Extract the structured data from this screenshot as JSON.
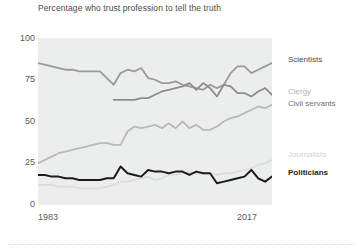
{
  "chart_data": {
    "type": "line",
    "title": "Percentage who trust profession to tell the truth",
    "xlabel": "",
    "ylabel": "",
    "xlim": [
      1983,
      2017
    ],
    "ylim": [
      0,
      100
    ],
    "yticks": [
      0,
      25,
      50,
      75,
      100
    ],
    "ytick_labels": [
      "0",
      "25",
      "50",
      "75",
      "100"
    ],
    "xticks": [
      1983,
      2017
    ],
    "xtick_labels": [
      "1983",
      "2017"
    ],
    "grid": false,
    "legend_position": "right-inline-labels",
    "x": [
      1983,
      1984,
      1985,
      1986,
      1987,
      1988,
      1989,
      1990,
      1991,
      1992,
      1993,
      1994,
      1995,
      1996,
      1997,
      1998,
      1999,
      2000,
      2001,
      2002,
      2003,
      2004,
      2005,
      2006,
      2007,
      2008,
      2009,
      2010,
      2011,
      2012,
      2013,
      2014,
      2015,
      2016,
      2017
    ],
    "series": [
      {
        "name": "Scientists",
        "color": "#9b9b9b",
        "label_color": "#4a4a4a",
        "width": 1.8,
        "values": [
          85,
          84,
          83,
          82,
          81,
          81,
          80,
          80,
          80,
          80,
          76,
          72,
          79,
          81,
          80,
          82,
          76,
          75,
          73,
          73,
          74,
          72,
          71,
          70,
          69,
          72,
          70,
          72,
          79,
          83,
          83,
          79,
          81,
          83,
          85
        ]
      },
      {
        "name": "Clergy",
        "color": "#8d8d8d",
        "label_color": "#b4b4b4",
        "width": 1.8,
        "values": [
          null,
          null,
          null,
          null,
          null,
          null,
          null,
          null,
          null,
          null,
          null,
          63,
          63,
          63,
          63,
          64,
          64,
          66,
          68,
          69,
          70,
          71,
          73,
          69,
          73,
          70,
          65,
          72,
          71,
          67,
          67,
          65,
          68,
          70,
          66
        ]
      },
      {
        "name": "Civil servants",
        "color": "#b9b9b9",
        "label_color": "#6e6e6e",
        "width": 1.8,
        "values": [
          25,
          27,
          29,
          31,
          32,
          33,
          34,
          35,
          36,
          37,
          37,
          36,
          36,
          44,
          47,
          46,
          47,
          48,
          46,
          49,
          46,
          50,
          46,
          48,
          45,
          45,
          47,
          50,
          52,
          53,
          55,
          57,
          59,
          58,
          60
        ]
      },
      {
        "name": "Journalists",
        "color": "#dcdcdc",
        "label_color": "#d2d2d2",
        "width": 1.8,
        "values": [
          12,
          12,
          12,
          11,
          11,
          11,
          10,
          10,
          10,
          10,
          11,
          12,
          14,
          14,
          15,
          16,
          17,
          15,
          16,
          18,
          18,
          19,
          20,
          19,
          19,
          19,
          18,
          19,
          19,
          20,
          21,
          22,
          24,
          25,
          27
        ]
      },
      {
        "name": "Politicians",
        "color": "#1c1c1c",
        "label_color": "#1c1c1c",
        "width": 2.0,
        "values": [
          18,
          18,
          17,
          17,
          16,
          16,
          15,
          15,
          15,
          15,
          16,
          16,
          23,
          19,
          18,
          17,
          21,
          20,
          20,
          19,
          20,
          20,
          18,
          20,
          19,
          19,
          13,
          14,
          15,
          16,
          17,
          21,
          16,
          14,
          17
        ]
      }
    ]
  },
  "axis": {
    "y_labels": {
      "y100": "100",
      "y75": "75",
      "y50": "50",
      "y25": "25",
      "y0": "0"
    },
    "x_labels": {
      "left": "1983",
      "right": "2017"
    }
  },
  "legend": {
    "scientists": "Scientists",
    "clergy": "Clergy",
    "civil_servants": "Civil servants",
    "journalists": "Journalists",
    "politicians": "Politicians"
  }
}
